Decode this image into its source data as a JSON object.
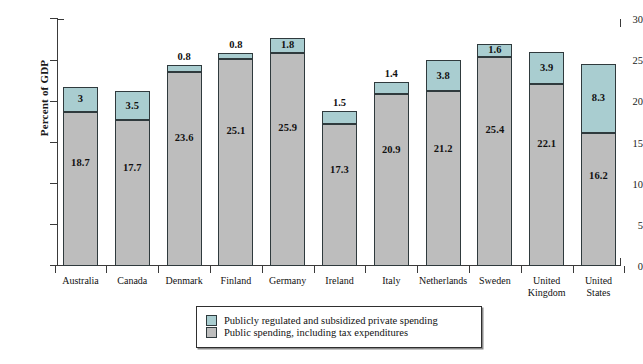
{
  "chart_data": {
    "type": "bar",
    "subtype": "stacked",
    "title": "",
    "xlabel": "",
    "ylabel": "Percent of GDP",
    "ylim": [
      0,
      30
    ],
    "ytick_step": 5,
    "yticks": [
      "0",
      "5",
      "10",
      "15",
      "20",
      "25",
      "30"
    ],
    "grid": false,
    "legend_position": "bottom-center",
    "categories": [
      "Australia",
      "Canada",
      "Denmark",
      "Finland",
      "Germany",
      "Ireland",
      "Italy",
      "Netherlands",
      "Sweden",
      "United\nKingdom",
      "United\nStates"
    ],
    "series": [
      {
        "name": "Public spending, including tax expenditures",
        "color": "#bdbdbd",
        "values": [
          18.7,
          17.7,
          23.6,
          25.1,
          25.9,
          17.3,
          20.9,
          21.2,
          25.4,
          22.1,
          16.2
        ],
        "labels": [
          "18.7",
          "17.7",
          "23.6",
          "25.1",
          "25.9",
          "17.3",
          "20.9",
          "21.2",
          "25.4",
          "22.1",
          "16.2"
        ]
      },
      {
        "name": "Publicly regulated and subsidized private spending",
        "color": "#a9cdd0",
        "values": [
          3.0,
          3.5,
          0.8,
          0.8,
          1.8,
          1.5,
          1.4,
          3.8,
          1.6,
          3.9,
          8.3
        ],
        "labels": [
          "3",
          "3.5",
          "0.8",
          "0.8",
          "1.8",
          "1.5",
          "1.4",
          "3.8",
          "1.6",
          "3.9",
          "8.3"
        ]
      }
    ],
    "totals": [
      21.7,
      21.2,
      24.4,
      25.9,
      27.7,
      18.8,
      22.3,
      25.0,
      27.0,
      26.0,
      24.5
    ]
  },
  "legend": {
    "items": [
      {
        "swatch": "private",
        "label": "Publicly regulated and subsidized private spending"
      },
      {
        "swatch": "public",
        "label": "Public spending, including tax expenditures"
      }
    ]
  }
}
